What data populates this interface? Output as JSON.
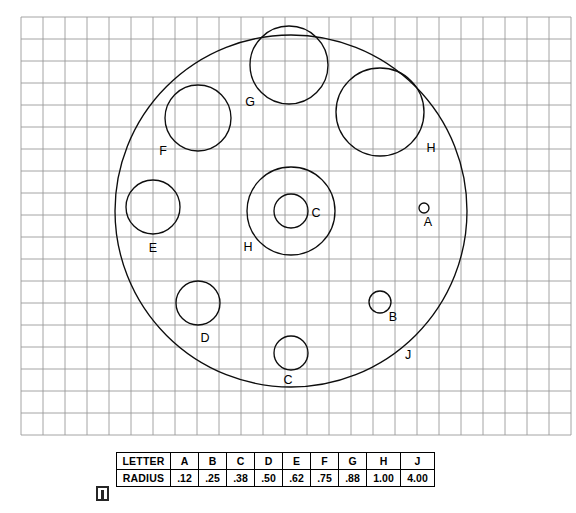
{
  "drawing": {
    "title": "Circle radius identification drawing",
    "grid": {
      "origin_x": 21,
      "origin_y": 17,
      "spacing": 22,
      "cols": 25,
      "rows": 19,
      "line_color": "#9a9a9a",
      "visible": true
    },
    "scale_px_per_unit": 44,
    "stroke_color": "#0d0d0d",
    "circles": [
      {
        "letter": "J",
        "cx": 291,
        "cy": 211,
        "r": 176,
        "label_x": 408,
        "label_y": 359,
        "label": "J"
      },
      {
        "letter": "G",
        "cx": 289,
        "cy": 65,
        "r": 39,
        "label_x": 250,
        "label_y": 106,
        "label": "G"
      },
      {
        "letter": "H",
        "cx": 380,
        "cy": 112,
        "r": 44,
        "label_x": 431,
        "label_y": 152,
        "label": "H"
      },
      {
        "letter": "F",
        "cx": 198,
        "cy": 118,
        "r": 33,
        "label_x": 163,
        "label_y": 155,
        "label": "F"
      },
      {
        "letter": "E",
        "cx": 153,
        "cy": 207,
        "r": 27,
        "label_x": 153,
        "label_y": 252,
        "label": "E"
      },
      {
        "letter": "H",
        "cx": 291,
        "cy": 211,
        "r": 44,
        "label_x": 248,
        "label_y": 251,
        "label": "H"
      },
      {
        "letter": "C",
        "cx": 291,
        "cy": 211,
        "r": 17,
        "label_x": 316,
        "label_y": 217,
        "label": "C"
      },
      {
        "letter": "A",
        "cx": 424,
        "cy": 208,
        "r": 5,
        "label_x": 428,
        "label_y": 226,
        "label": "A"
      },
      {
        "letter": "D",
        "cx": 198,
        "cy": 303,
        "r": 22,
        "label_x": 205,
        "label_y": 342,
        "label": "D"
      },
      {
        "letter": "B",
        "cx": 380,
        "cy": 302,
        "r": 11,
        "label_x": 393,
        "label_y": 321,
        "label": "B"
      },
      {
        "letter": "C",
        "cx": 291,
        "cy": 353,
        "r": 17,
        "label_x": 288,
        "label_y": 384,
        "label": "C"
      }
    ]
  },
  "legend": {
    "row_headers": [
      "LETTER",
      "RADIUS"
    ],
    "letters": [
      "A",
      "B",
      "C",
      "D",
      "E",
      "F",
      "G",
      "H",
      "J"
    ],
    "radii": [
      ".12",
      ".25",
      ".38",
      ".50",
      ".62",
      ".75",
      ".88",
      "1.00",
      "4.00"
    ]
  },
  "chart_data": {
    "type": "table",
    "columns": [
      "LETTER",
      "A",
      "B",
      "C",
      "D",
      "E",
      "F",
      "G",
      "H",
      "J"
    ],
    "rows": [
      [
        "LETTER",
        "A",
        "B",
        "C",
        "D",
        "E",
        "F",
        "G",
        "H",
        "J"
      ],
      [
        "RADIUS",
        ".12",
        ".25",
        ".38",
        ".50",
        ".62",
        ".75",
        ".88",
        "1.00",
        "4.00"
      ]
    ],
    "categories": [
      "A",
      "B",
      "C",
      "D",
      "E",
      "F",
      "G",
      "H",
      "J"
    ],
    "values": [
      0.12,
      0.25,
      0.38,
      0.5,
      0.62,
      0.75,
      0.88,
      1.0,
      4.0
    ],
    "xlabel": "LETTER",
    "ylabel": "RADIUS",
    "grid": true,
    "legend_position": "none"
  }
}
